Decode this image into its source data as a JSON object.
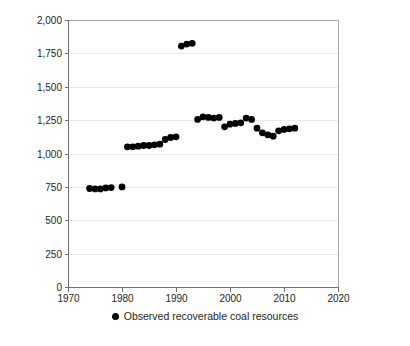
{
  "chart_data": {
    "type": "scatter",
    "title": "",
    "subtitle": "",
    "xlabel": "",
    "ylabel": "",
    "xlim": [
      1970,
      2020
    ],
    "ylim": [
      0,
      2000
    ],
    "xticks": [
      1970,
      1980,
      1990,
      2000,
      2010,
      2020
    ],
    "xtick_labels": [
      "1970",
      "1980",
      "1990",
      "2000",
      "2010",
      "2020"
    ],
    "yticks": [
      0,
      250,
      500,
      750,
      1000,
      1250,
      1500,
      1750,
      2000
    ],
    "ytick_labels": [
      "0",
      "250",
      "500",
      "750",
      "1,000",
      "1,250",
      "1,500",
      "1,750",
      "2,000"
    ],
    "grid": true,
    "grid_axis": "y",
    "legend_position": "bottom-center",
    "marker": "circle",
    "marker_color": "#000000",
    "series": [
      {
        "name": "Observed recoverable coal resources",
        "x": [
          1974,
          1975,
          1976,
          1977,
          1978,
          1980,
          1981,
          1982,
          1983,
          1984,
          1985,
          1986,
          1987,
          1988,
          1989,
          1990,
          1991,
          1992,
          1993,
          1994,
          1995,
          1996,
          1997,
          1998,
          1999,
          2000,
          2001,
          2002,
          2003,
          2004,
          2005,
          2006,
          2007,
          2008,
          2009,
          2010,
          2011,
          2012
        ],
        "values": [
          738,
          735,
          735,
          742,
          745,
          750,
          1050,
          1050,
          1055,
          1060,
          1060,
          1065,
          1070,
          1105,
          1120,
          1125,
          1805,
          1820,
          1825,
          1255,
          1275,
          1270,
          1265,
          1270,
          1200,
          1220,
          1225,
          1230,
          1265,
          1255,
          1190,
          1155,
          1140,
          1130,
          1170,
          1180,
          1185,
          1190
        ]
      }
    ]
  },
  "legend": {
    "entries": [
      {
        "label": "Observed recoverable coal resources",
        "color": "#000000"
      }
    ]
  }
}
